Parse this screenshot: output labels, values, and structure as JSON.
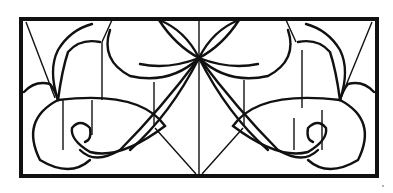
{
  "artwork": {
    "subject": "Stained glass window pattern, symmetric Art Nouveau design",
    "colors": {
      "background": "#ffffff",
      "line": "#111111"
    }
  }
}
